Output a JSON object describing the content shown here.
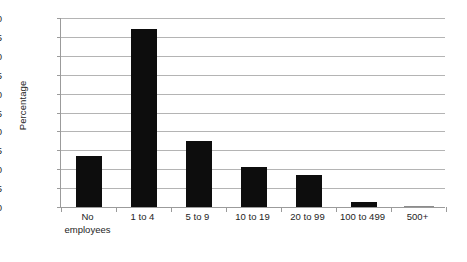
{
  "chart_data": {
    "type": "bar",
    "title": "",
    "subtitle": "",
    "xlabel": "",
    "ylabel": "Percentage",
    "categories": [
      "No employees",
      "1 to 4",
      "5 to 9",
      "10 to 19",
      "20 to 99",
      "100 to 499",
      "500+"
    ],
    "category_lines": [
      [
        "No",
        "employees"
      ],
      [
        "1 to 4",
        ""
      ],
      [
        "5 to 9",
        ""
      ],
      [
        "10 to 19",
        ""
      ],
      [
        "20 to 99",
        ""
      ],
      [
        "100 to 499",
        ""
      ],
      [
        "500+",
        ""
      ]
    ],
    "values": [
      13.5,
      47.0,
      17.5,
      10.5,
      8.6,
      1.2,
      0.1
    ],
    "ylim": [
      0,
      50
    ],
    "y_ticks": [
      0,
      5,
      10,
      15,
      20,
      25,
      30,
      35,
      40,
      45,
      50
    ],
    "y_tick_labels": [
      "0",
      "5",
      "10",
      "15",
      "20",
      "25",
      "30",
      "35",
      "40",
      "45",
      "50"
    ],
    "grid": true,
    "grid_axis": "y",
    "legend": false,
    "legend_position": "none",
    "bar_color": "#0d0d0d",
    "grid_color": "#b4b4b4",
    "axis_color": "#9b9b9b",
    "text_color": "#242424",
    "background_color": "#ffffff"
  }
}
